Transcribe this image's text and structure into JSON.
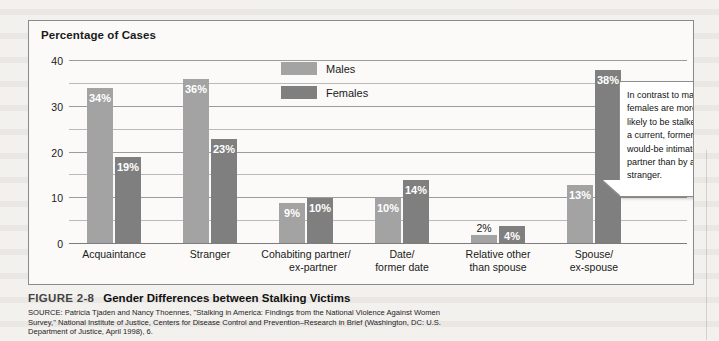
{
  "figure": {
    "number": "FIGURE 2-8",
    "title": "Gender Differences between Stalking Victims",
    "source": "SOURCE: Patricia Tjaden and Nancy Thoennes, \"Stalking in America: Findings from the National Violence Against Women Survey,\" National Institute of Justice, Centers for Disease Control and Prevention–Research in Brief (Washington, DC: U.S. Department of Justice, April 1998), 6."
  },
  "callout": {
    "text": "In contrast to males, females are more likely to be stalked by a current, former, or would-be intimate partner than by a stranger."
  },
  "chart_data": {
    "type": "bar",
    "title": "Percentage of Cases",
    "xlabel": "",
    "ylabel": "Percentage of Cases",
    "ylim": [
      0,
      40
    ],
    "yticks": [
      0,
      10,
      20,
      30,
      40
    ],
    "ytick_labels": [
      "0",
      "10",
      "20",
      "30",
      "40"
    ],
    "minor_gridlines": [
      5,
      15,
      25,
      35
    ],
    "grid": true,
    "legend_position": "top-center",
    "categories": [
      "Acquaintance",
      "Stranger",
      "Cohabiting partner/ ex-partner",
      "Date/ former date",
      "Relative other than spouse",
      "Spouse/ ex-spouse"
    ],
    "category_lines": [
      [
        "Acquaintance",
        ""
      ],
      [
        "Stranger",
        ""
      ],
      [
        "Cohabiting partner/",
        "ex-partner"
      ],
      [
        "Date/",
        "former date"
      ],
      [
        "Relative other",
        "than spouse"
      ],
      [
        "Spouse/",
        "ex-spouse"
      ]
    ],
    "series": [
      {
        "name": "Males",
        "color": "#a3a3a3",
        "values": [
          34,
          36,
          9,
          10,
          2,
          13
        ],
        "labels": [
          "34%",
          "36%",
          "9%",
          "10%",
          "2%",
          "13%"
        ],
        "label_outside": [
          false,
          false,
          false,
          false,
          true,
          false
        ]
      },
      {
        "name": "Females",
        "color": "#7f7f7f",
        "values": [
          19,
          23,
          10,
          14,
          4,
          38
        ],
        "labels": [
          "19%",
          "23%",
          "10%",
          "14%",
          "4%",
          "38%"
        ],
        "label_outside": [
          false,
          false,
          false,
          false,
          false,
          false
        ]
      }
    ]
  }
}
